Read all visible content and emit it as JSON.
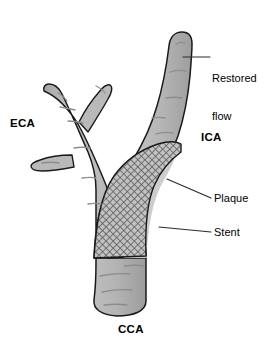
{
  "figure": {
    "background_color": "#ffffff",
    "width": 280,
    "height": 344
  },
  "colors": {
    "vessel_fill": "#b5b5b5",
    "vessel_fill_light": "#c4c4c4",
    "plaque_fill": "#c9c9c9",
    "stent_hatch": "#6e6e6e",
    "outline": "#1a1a1a",
    "texture_line": "#8a8a8a",
    "leader_line": "#2a2a2a",
    "label_text": "#000000"
  },
  "labels": {
    "eca": {
      "text": "ECA",
      "style": "bold"
    },
    "ica": {
      "text": "ICA",
      "style": "bold"
    },
    "cca": {
      "text": "CCA",
      "style": "bold"
    },
    "restored_flow": {
      "line1": "Restored",
      "line2": "flow",
      "style": "plain"
    },
    "plaque": {
      "text": "Plaque",
      "style": "plain"
    },
    "stent": {
      "text": "Stent",
      "style": "plain"
    }
  },
  "anatomy": {
    "vessels": [
      {
        "name": "common-carotid-artery",
        "abbr": "CCA",
        "position": "bottom"
      },
      {
        "name": "internal-carotid-artery",
        "abbr": "ICA",
        "position": "upper-right"
      },
      {
        "name": "external-carotid-artery",
        "abbr": "ECA",
        "position": "upper-left"
      }
    ],
    "findings": [
      {
        "name": "plaque",
        "description": "eccentric atherosclerotic plaque at the ICA origin"
      },
      {
        "name": "stent",
        "description": "cross-hatched stent spanning the bifurcation into the ICA"
      },
      {
        "name": "restored-flow",
        "description": "patent distal ICA lumen above the stent"
      }
    ]
  },
  "leader_lines": [
    {
      "name": "restored-flow-leader",
      "from": [
        183,
        57
      ],
      "to": [
        210,
        57
      ]
    },
    {
      "name": "plaque-leader",
      "from": [
        166,
        178
      ],
      "to": [
        211,
        198
      ]
    },
    {
      "name": "stent-leader",
      "from": [
        158,
        226
      ],
      "to": [
        211,
        232
      ]
    }
  ]
}
